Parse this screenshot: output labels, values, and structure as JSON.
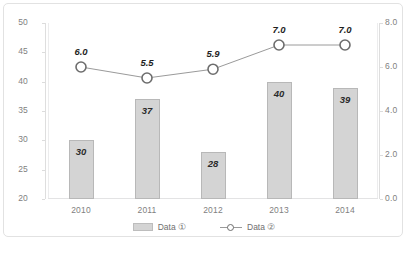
{
  "chart_data": {
    "type": "bar",
    "title": "",
    "subtitle": "",
    "xlabel": "",
    "ylabel": "",
    "categories": [
      "2010",
      "2011",
      "2012",
      "2013",
      "2014"
    ],
    "series": [
      {
        "name": "Data ①",
        "type": "bar",
        "axis": "left",
        "values": [
          30,
          37,
          28,
          40,
          39
        ],
        "labels": [
          "30",
          "37",
          "28",
          "40",
          "39"
        ],
        "color": "#d4d4d4",
        "border_color": "#b8b8b8"
      },
      {
        "name": "Data ②",
        "type": "line",
        "axis": "right",
        "values": [
          6.0,
          5.5,
          5.9,
          7.0,
          7.0
        ],
        "labels": [
          "6.0",
          "5.5",
          "5.9",
          "7.0",
          "7.0"
        ],
        "color": "#9a9a9a",
        "marker": "open-circle"
      }
    ],
    "left_axis": {
      "ticks": [
        "50",
        "45",
        "40",
        "35",
        "30",
        "25",
        "20"
      ],
      "min": 20,
      "max": 50,
      "step": 5
    },
    "right_axis": {
      "ticks": [
        "8.0",
        "6.0",
        "4.0",
        "2.0",
        "0.0"
      ],
      "min": 0,
      "max": 8,
      "step": 2
    },
    "grid": false,
    "legend_position": "bottom"
  },
  "legend": {
    "items": [
      {
        "label": "Data ①",
        "marker": "bar-swatch"
      },
      {
        "label": "Data ②",
        "marker": "line-circle-marker"
      }
    ]
  },
  "footer": {
    "caption": ""
  }
}
